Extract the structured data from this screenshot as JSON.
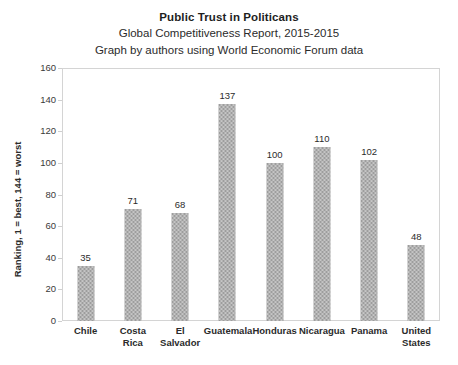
{
  "chart_data": {
    "type": "bar",
    "title": "Public Trust in Politicans",
    "subtitle": "Global Competitiveness Report, 2015-2015",
    "subtitle2": "Graph by authors using World Economic Forum data",
    "xlabel": "",
    "ylabel": "Ranking, 1 = best, 144 = worst",
    "ylim": [
      0,
      160
    ],
    "ytick_step": 20,
    "yticks": [
      0,
      20,
      40,
      60,
      80,
      100,
      120,
      140,
      160
    ],
    "grid": false,
    "legend": "none",
    "bar_color": "#9d9d9d",
    "categories": [
      "Chile",
      "Costa Rica",
      "El Salvador",
      "Guatemala",
      "Honduras",
      "Nicaragua",
      "Panama",
      "United States"
    ],
    "values": [
      35,
      71,
      68,
      137,
      100,
      110,
      102,
      48
    ],
    "data_labels": [
      "35",
      "71",
      "68",
      "137",
      "100",
      "110",
      "102",
      "48"
    ]
  }
}
